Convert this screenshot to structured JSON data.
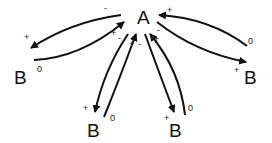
{
  "diagram": {
    "nodes": [
      {
        "id": "A",
        "label": "A",
        "x": 145,
        "y": 24
      },
      {
        "id": "B1",
        "label": "B",
        "x": 20,
        "y": 84
      },
      {
        "id": "B2",
        "label": "B",
        "x": 90,
        "y": 137
      },
      {
        "id": "B3",
        "label": "B",
        "x": 171,
        "y": 137
      },
      {
        "id": "B4",
        "label": "B",
        "x": 248,
        "y": 84
      }
    ],
    "edge_labels": {
      "minus": "-",
      "plus": "+",
      "zero": "0"
    },
    "edges": [
      {
        "from": "A",
        "to": "B1",
        "source_sign": "-",
        "target_sign": "+"
      },
      {
        "from": "B1",
        "to": "A",
        "source_sign": "0",
        "target_sign": "+"
      },
      {
        "from": "A",
        "to": "B2",
        "source_sign": "-",
        "target_sign": "+"
      },
      {
        "from": "B2",
        "to": "A",
        "source_sign": "0",
        "target_sign": "+"
      },
      {
        "from": "A",
        "to": "B3",
        "source_sign": "-",
        "target_sign": "+"
      },
      {
        "from": "B3",
        "to": "A",
        "source_sign": "0",
        "target_sign": "+"
      },
      {
        "from": "A",
        "to": "B4",
        "source_sign": "-",
        "target_sign": "+"
      },
      {
        "from": "B4",
        "to": "A",
        "source_sign": "0",
        "target_sign": "+"
      }
    ],
    "colors": {
      "stroke": "#111111",
      "background": "#ffffff"
    }
  }
}
